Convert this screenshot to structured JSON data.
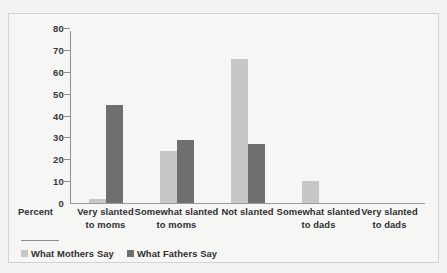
{
  "chart_data": {
    "type": "bar",
    "title": "",
    "subtitle": "",
    "xlabel": "",
    "ylabel": "Percent",
    "ylim": [
      0,
      80
    ],
    "yticks": [
      0,
      10,
      20,
      30,
      40,
      50,
      60,
      70,
      80
    ],
    "grid": false,
    "legend_position": "bottom-left",
    "categories": [
      "Very slanted\nto moms",
      "Somewhat slanted\nto moms",
      "Not slanted",
      "Somewhat slanted\nto dads",
      "Very slanted\nto dads"
    ],
    "category_lines": [
      [
        "Very slanted",
        "to moms"
      ],
      [
        "Somewhat slanted",
        "to moms"
      ],
      [
        "Not slanted",
        ""
      ],
      [
        "Somewhat slanted",
        "to dads"
      ],
      [
        "Very slanted",
        "to dads"
      ]
    ],
    "series": [
      {
        "name": "What Mothers Say",
        "color": "#c7c7c5",
        "values": [
          2,
          24,
          66,
          10,
          0
        ]
      },
      {
        "name": "What Fathers Say",
        "color": "#6f6f6f",
        "values": [
          45,
          29,
          27,
          0,
          0
        ]
      }
    ]
  },
  "axis": {
    "y_title": "Percent"
  },
  "legend": {
    "items": [
      {
        "label": "What Mothers Say",
        "color": "#c7c7c5"
      },
      {
        "label": "What Fathers Say",
        "color": "#6f6f6f"
      }
    ]
  },
  "colors": {
    "mothers": "#c7c7c5",
    "fathers": "#6f6f6f",
    "axis": "#8e8e8b",
    "text": "#2f2f31",
    "background": "#f6f6f4",
    "frame": "#d2d2cf"
  }
}
